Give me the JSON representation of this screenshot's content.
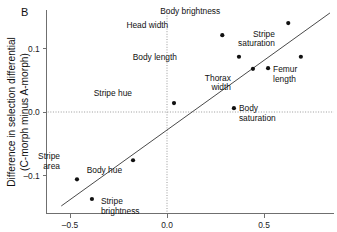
{
  "panel": {
    "label": "B"
  },
  "chart_data": {
    "type": "scatter",
    "title": "",
    "xlabel": "",
    "ylabel": "Difference in selection differential (C-morph minus A-morph)",
    "ylabel_line1": "Difference in selection differential",
    "ylabel_line2": "(C-morph minus A-morph)",
    "xlim": [
      -0.62,
      0.86
    ],
    "ylim": [
      -0.16,
      0.16
    ],
    "xticks": [
      "–0.5",
      "0.0",
      "0.5"
    ],
    "xtick_values": [
      -0.5,
      0.0,
      0.5
    ],
    "yticks": [
      "0.1",
      "0.0",
      "–0.1"
    ],
    "ytick_values": [
      0.1,
      0.0,
      -0.1
    ],
    "grid": false,
    "legend": "none",
    "reference_lines": [
      {
        "name": "y-zero",
        "orientation": "horizontal",
        "value": 0.0,
        "style": "dotted"
      },
      {
        "name": "x-zero",
        "orientation": "vertical",
        "value": 0.0,
        "style": "dotted"
      }
    ],
    "fit_line": {
      "name": "regression-line",
      "x0": -0.545,
      "y0": -0.148,
      "x1": 0.84,
      "y1": 0.156
    },
    "points": [
      {
        "label": "Body brightness",
        "x": 0.625,
        "y": 0.14,
        "label_dx": -68,
        "label_dy": -9
      },
      {
        "label": "Head width",
        "x": 0.285,
        "y": 0.121,
        "label_dx": -54,
        "label_dy": -7
      },
      {
        "label": "Stripe saturation",
        "x": 0.69,
        "y": 0.087,
        "label_dx": -26,
        "label_dy": -20,
        "two_line": true,
        "line1": "Stripe",
        "line2": "saturation"
      },
      {
        "label": "Body length",
        "x": 0.371,
        "y": 0.087,
        "label_dx": -62,
        "label_dy": 3
      },
      {
        "label": "Femur length",
        "x": 0.521,
        "y": 0.069,
        "label_dx": 5,
        "label_dy": 4,
        "two_line": true,
        "line1": "Femur",
        "line2": "length"
      },
      {
        "label": "Thorax width",
        "x": 0.443,
        "y": 0.068,
        "label_dx": -22,
        "label_dy": 12,
        "two_line": true,
        "line1": "Thorax",
        "line2": "width"
      },
      {
        "label": "Stripe hue",
        "x": 0.036,
        "y": 0.014,
        "label_dx": -42,
        "label_dy": -7
      },
      {
        "label": "Body saturation",
        "x": 0.345,
        "y": 0.006,
        "label_dx": 5,
        "label_dy": 3,
        "two_line": true,
        "line1": "Body",
        "line2": "saturation"
      },
      {
        "label": "Body hue",
        "x": -0.175,
        "y": -0.076,
        "label_dx": -11,
        "label_dy": 13
      },
      {
        "label": "Stripe area",
        "x": -0.464,
        "y": -0.106,
        "label_dx": -17,
        "label_dy": -20,
        "two_line": true,
        "line1": "Stripe",
        "line2": "area"
      },
      {
        "label": "Stripe brightness",
        "x": -0.387,
        "y": -0.137,
        "label_dx": 9,
        "label_dy": 5,
        "two_line": true,
        "line1": "Stripe",
        "line2": "brightness"
      }
    ]
  }
}
